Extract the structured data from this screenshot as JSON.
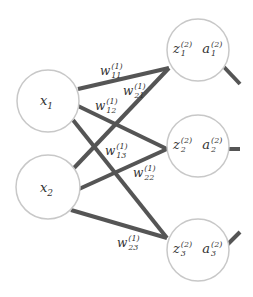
{
  "diagram": {
    "type": "neural-network-layer",
    "inputs": [
      {
        "id": "x1",
        "label": "x",
        "sub": "1",
        "cx": 48,
        "cy": 101
      },
      {
        "id": "x2",
        "label": "x",
        "sub": "2",
        "cx": 48,
        "cy": 187
      }
    ],
    "hidden": [
      {
        "id": "h1",
        "z": "z",
        "a": "a",
        "sub": "1",
        "sup": "(2)",
        "cx": 198,
        "cy": 50
      },
      {
        "id": "h2",
        "z": "z",
        "a": "a",
        "sub": "2",
        "sup": "(2)",
        "cx": 198,
        "cy": 146
      },
      {
        "id": "h3",
        "z": "z",
        "a": "a",
        "sub": "3",
        "sup": "(2)",
        "cx": 198,
        "cy": 250
      }
    ],
    "weights": [
      {
        "label": "w",
        "sub": "11",
        "sup": "(1)",
        "from": "x1",
        "to": "h1"
      },
      {
        "label": "w",
        "sub": "21",
        "sup": "(1)",
        "from": "x2",
        "to": "h1"
      },
      {
        "label": "w",
        "sub": "12",
        "sup": "(1)",
        "from": "x1",
        "to": "h2"
      },
      {
        "label": "w",
        "sub": "13",
        "sup": "(1)",
        "from": "x1",
        "to": "h3"
      },
      {
        "label": "w",
        "sub": "22",
        "sup": "(1)",
        "from": "x2",
        "to": "h2"
      },
      {
        "label": "w",
        "sub": "23",
        "sup": "(1)",
        "from": "x2",
        "to": "h3"
      }
    ],
    "colors": {
      "edge": "#555555",
      "node_stroke": "#c8c8c8",
      "text": "#333333"
    }
  }
}
